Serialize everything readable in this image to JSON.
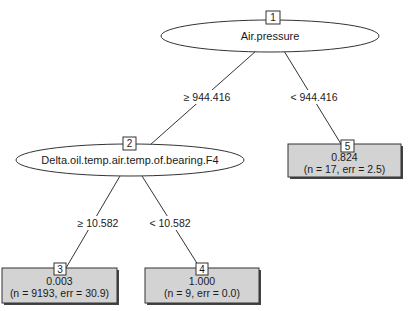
{
  "tree": {
    "colors": {
      "terminal_fill": "#d3d3d3",
      "border": "#333333",
      "background": "#ffffff"
    },
    "nodes": [
      {
        "id": "1",
        "type": "inner",
        "variable": "Air.pressure"
      },
      {
        "id": "2",
        "type": "inner",
        "variable": "Delta.oil.temp.air.temp.of.bearing.F4"
      },
      {
        "id": "3",
        "type": "terminal",
        "value": "0.003",
        "stats": "(n = 9193, err = 30.9)"
      },
      {
        "id": "4",
        "type": "terminal",
        "value": "1.000",
        "stats": "(n = 9, err = 0.0)"
      },
      {
        "id": "5",
        "type": "terminal",
        "value": "0.824",
        "stats": "(n = 17, err = 2.5)"
      }
    ],
    "edges": [
      {
        "from": "1",
        "to": "2",
        "label": "≥ 944.416"
      },
      {
        "from": "1",
        "to": "5",
        "label": "< 944.416"
      },
      {
        "from": "2",
        "to": "3",
        "label": "≥ 10.582"
      },
      {
        "from": "2",
        "to": "4",
        "label": "< 10.582"
      }
    ]
  }
}
